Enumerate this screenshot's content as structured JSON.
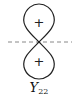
{
  "diagram": {
    "type": "orbital-lobe-diagram",
    "upper_lobe": {
      "sign": "+"
    },
    "lower_lobe": {
      "sign": "+"
    },
    "axis": {
      "style": "dashed"
    },
    "label": {
      "symbol": "Y",
      "subscript": "22"
    },
    "colors": {
      "stroke": "#222222",
      "axis": "#888888",
      "background": "#ffffff"
    }
  }
}
